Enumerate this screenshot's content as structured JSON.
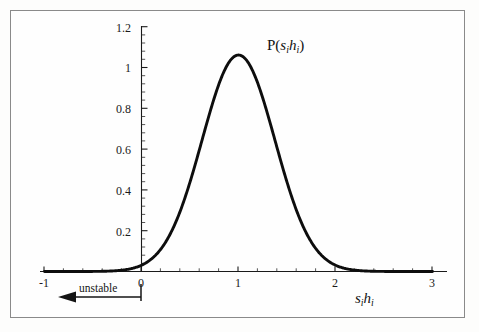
{
  "figure": {
    "background": "#fdfdfc",
    "frame_color": "#8a8a8a",
    "curve_color": "#0d0d0d",
    "axis_color": "#1a1a1a"
  },
  "chart_data": {
    "type": "line",
    "title_parts": {
      "fn": "P",
      "open": "(",
      "s": "s",
      "si": "i",
      "h": "h",
      "hi": "i",
      "close": ")"
    },
    "xlabel_parts": {
      "s": "s",
      "si": "i",
      "h": "h",
      "hi": "i"
    },
    "xlabel": "sᵢhᵢ",
    "ylabel": "",
    "xlim": [
      -1,
      3
    ],
    "ylim": [
      0,
      1.2
    ],
    "grid": false,
    "legend": null,
    "xticks": [
      -1,
      0,
      1,
      2,
      3
    ],
    "xticklabels": [
      "-1",
      "0",
      "1",
      "2",
      "3"
    ],
    "yticks": [
      0.2,
      0.4,
      0.6,
      0.8,
      1,
      1.2
    ],
    "yticklabels": [
      "0.2",
      "0.4",
      "0.6",
      "0.8",
      "1",
      "1.2"
    ],
    "x_minor_per_interval": 5,
    "y_minor_per_interval": 5,
    "distribution": {
      "kind": "gaussian",
      "mean": 1.0,
      "sigma": 0.376,
      "peak": 1.061
    },
    "x": [
      -1.0,
      -0.8,
      -0.6,
      -0.4,
      -0.2,
      -0.1,
      0.0,
      0.1,
      0.2,
      0.3,
      0.4,
      0.5,
      0.6,
      0.7,
      0.8,
      0.9,
      1.0,
      1.1,
      1.2,
      1.3,
      1.4,
      1.5,
      1.6,
      1.7,
      1.8,
      1.9,
      2.0,
      2.1,
      2.2,
      2.3,
      2.4,
      2.6,
      2.8,
      3.0
    ],
    "y": [
      0.0,
      0.0,
      0.0,
      0.001,
      0.005,
      0.01,
      0.02,
      0.037,
      0.065,
      0.108,
      0.171,
      0.255,
      0.36,
      0.48,
      0.604,
      0.719,
      0.808,
      0.861,
      0.872,
      0.84,
      0.772,
      0.678,
      0.572,
      0.464,
      0.362,
      0.272,
      0.197,
      0.137,
      0.092,
      0.059,
      0.036,
      0.012,
      0.003,
      0.001
    ],
    "annotations": [
      {
        "name": "unstable-arrow",
        "text": "unstable",
        "from_x": 0.0,
        "to_x": -0.85,
        "direction": "left"
      }
    ]
  },
  "annotation": {
    "unstable_text": "unstable"
  }
}
